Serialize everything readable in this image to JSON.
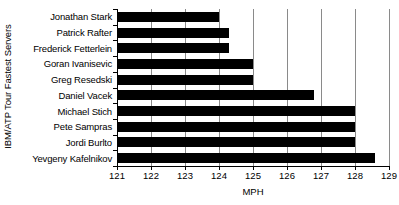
{
  "chart_data": {
    "type": "bar",
    "orientation": "horizontal",
    "title": "",
    "xlabel": "MPH",
    "ylabel": "IBM/ATP Tour Fastest Servers",
    "xlim": [
      121,
      129
    ],
    "ylim": null,
    "grid": true,
    "legend": null,
    "bar_color": "#000000",
    "categories": [
      "Jonathan Stark",
      "Patrick Rafter",
      "Frederick Fetterlein",
      "Goran Ivanisevic",
      "Greg Resedski",
      "Daniel Vacek",
      "Michael Stich",
      "Pete Sampras",
      "Jordi Burlto",
      "Yevgeny Kafelnikov"
    ],
    "values": [
      124.0,
      124.3,
      124.3,
      125.0,
      125.0,
      126.8,
      128.0,
      128.0,
      128.0,
      128.6
    ],
    "xticks": [
      121,
      122,
      123,
      124,
      125,
      126,
      127,
      128,
      129
    ],
    "xtick_labels": [
      "121",
      "122",
      "123",
      "124",
      "125",
      "126",
      "127",
      "128",
      "129"
    ]
  }
}
